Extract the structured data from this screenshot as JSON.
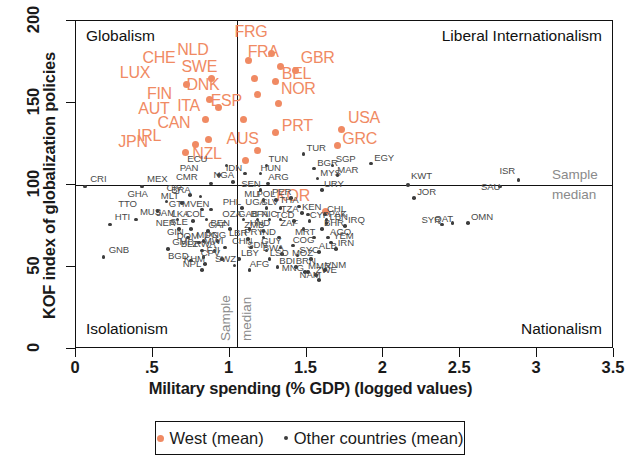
{
  "chart_data": {
    "type": "scatter",
    "title": "",
    "xlabel": "Military spending (% GDP) (logged values)",
    "ylabel": "KOF index of globalization policies",
    "xlim": [
      0,
      3.5
    ],
    "ylim": [
      0,
      200
    ],
    "xticks": [
      "0",
      ".5",
      "1",
      "1.5",
      "2",
      "2.5",
      "3",
      "3.5"
    ],
    "xtick_values": [
      0,
      0.5,
      1,
      1.5,
      2,
      2.5,
      3,
      3.5
    ],
    "yticks": [
      "0",
      "50",
      "100",
      "150",
      "200"
    ],
    "ytick_values": [
      0,
      50,
      100,
      150,
      200
    ],
    "grid": false,
    "median_x": 1.05,
    "median_y": 100,
    "median_label_line1": "Sample",
    "median_label_line2": "median",
    "quadrants": {
      "top_left": "Globalism",
      "top_right": "Liberal Internationalism",
      "bottom_left": "Isolationism",
      "bottom_right": "Nationalism"
    },
    "legend": {
      "position": "bottom-center",
      "entries": [
        {
          "name": "West (mean)",
          "color": "#f08a63",
          "marker": "circle-large"
        },
        {
          "name": "Other countries (mean)",
          "color": "#3d3d3d",
          "marker": "circle-small"
        }
      ]
    },
    "series": [
      {
        "name": "West (mean)",
        "color": "#f08a63",
        "points": [
          {
            "label": "LUX",
            "x": 0.72,
            "y": 161,
            "lx": -38,
            "ly": -9
          },
          {
            "label": "CHE",
            "x": 0.88,
            "y": 165,
            "lx": -40,
            "ly": -18
          },
          {
            "label": "FIN",
            "x": 0.87,
            "y": 152,
            "lx": -34,
            "ly": -3
          },
          {
            "label": "ITA",
            "x": 0.93,
            "y": 147,
            "lx": -13,
            "ly": 1
          },
          {
            "label": "AUT",
            "x": 0.84,
            "y": 140,
            "lx": -38,
            "ly": -8
          },
          {
            "label": "CAN",
            "x": 0.86,
            "y": 128,
            "lx": -22,
            "ly": -14
          },
          {
            "label": "IRL",
            "x": 0.78,
            "y": 125,
            "lx": -30,
            "ly": -5
          },
          {
            "label": "JPN",
            "x": 0.71,
            "y": 120,
            "lx": -38,
            "ly": -8
          },
          {
            "label": "NLD",
            "x": 1.12,
            "y": 176,
            "lx": -42,
            "ly": -8
          },
          {
            "label": "SWE",
            "x": 1.16,
            "y": 165,
            "lx": -44,
            "ly": -9
          },
          {
            "label": "DNK",
            "x": 1.18,
            "y": 155,
            "lx": -42,
            "ly": -7
          },
          {
            "label": "ESP",
            "x": 1.09,
            "y": 140,
            "lx": -4,
            "ly": -16
          },
          {
            "label": "NZL",
            "x": 1.1,
            "y": 115,
            "lx": -24,
            "ly": -4
          },
          {
            "label": "AUS",
            "x": 1.18,
            "y": 121,
            "lx": -2,
            "ly": -9
          },
          {
            "label": "FRG",
            "x": 1.27,
            "y": 180,
            "lx": -8,
            "ly": -19
          },
          {
            "label": "FRA",
            "x": 1.33,
            "y": 172,
            "lx": -4,
            "ly": -12
          },
          {
            "label": "GBR",
            "x": 1.43,
            "y": 170,
            "lx": 5,
            "ly": -10
          },
          {
            "label": "BEL",
            "x": 1.3,
            "y": 163,
            "lx": 6,
            "ly": -5
          },
          {
            "label": "NOR",
            "x": 1.32,
            "y": 150,
            "lx": 2,
            "ly": -11
          },
          {
            "label": "PRT",
            "x": 1.3,
            "y": 132,
            "lx": 6,
            "ly": -4
          },
          {
            "label": "USA",
            "x": 1.73,
            "y": 134,
            "lx": 6,
            "ly": -9
          },
          {
            "label": "GRC",
            "x": 1.7,
            "y": 124,
            "lx": 5,
            "ly": -4
          },
          {
            "label": "KOR",
            "x": 1.62,
            "y": 84,
            "lx": -20,
            "ly": -13
          }
        ]
      },
      {
        "name": "Other countries (mean)",
        "color": "#3d3d3d",
        "points": [
          {
            "label": "CRI",
            "x": 0.06,
            "y": 99,
            "lx": 5,
            "ly": -7
          },
          {
            "label": "MEX",
            "x": 0.43,
            "y": 99,
            "lx": 5,
            "ly": -7
          },
          {
            "label": "HTI",
            "x": 0.22,
            "y": 76,
            "lx": 5,
            "ly": -6
          },
          {
            "label": "GNB",
            "x": 0.18,
            "y": 56,
            "lx": 5,
            "ly": -6
          },
          {
            "label": "MUS",
            "x": 0.39,
            "y": 79,
            "lx": 4,
            "ly": -7
          },
          {
            "label": "TTO",
            "x": 0.53,
            "y": 84,
            "lx": -22,
            "ly": -6
          },
          {
            "label": "GHA",
            "x": 0.59,
            "y": 90,
            "lx": -22,
            "ly": -6
          },
          {
            "label": "MLT",
            "x": 0.69,
            "y": 89,
            "lx": -4,
            "ly": -6
          },
          {
            "label": "JAM",
            "x": 0.66,
            "y": 79,
            "lx": -4,
            "ly": -6
          },
          {
            "label": "LKA",
            "x": 0.76,
            "y": 78,
            "lx": -4,
            "ly": -6
          },
          {
            "label": "NER",
            "x": 0.67,
            "y": 73,
            "lx": -6,
            "ly": -5
          },
          {
            "label": "SLE",
            "x": 0.75,
            "y": 73,
            "lx": -4,
            "ly": -6
          },
          {
            "label": "GIN",
            "x": 0.73,
            "y": 68,
            "lx": -4,
            "ly": -5
          },
          {
            "label": "DOM",
            "x": 0.8,
            "y": 65,
            "lx": -5,
            "ly": -5
          },
          {
            "label": "PNG",
            "x": 0.83,
            "y": 66,
            "lx": 2,
            "ly": -5
          },
          {
            "label": "GMB",
            "x": 0.6,
            "y": 61,
            "lx": 4,
            "ly": -6
          },
          {
            "label": "BLZ",
            "x": 0.82,
            "y": 60,
            "lx": -4,
            "ly": -6
          },
          {
            "label": "RWA",
            "x": 0.9,
            "y": 60,
            "lx": -3,
            "ly": -6
          },
          {
            "label": "FJI",
            "x": 0.83,
            "y": 56,
            "lx": 3,
            "ly": -6
          },
          {
            "label": "BGD",
            "x": 0.75,
            "y": 54,
            "lx": -6,
            "ly": -4
          },
          {
            "label": "KHM",
            "x": 0.84,
            "y": 52,
            "lx": -4,
            "ly": -4
          },
          {
            "label": "NPL",
            "x": 0.82,
            "y": 48,
            "lx": -2,
            "ly": -5
          },
          {
            "label": "CIV",
            "x": 0.74,
            "y": 94,
            "lx": -6,
            "ly": -6
          },
          {
            "label": "BRA",
            "x": 0.81,
            "y": 93,
            "lx": -12,
            "ly": -6
          },
          {
            "label": "GTM",
            "x": 0.82,
            "y": 85,
            "lx": -16,
            "ly": -5
          },
          {
            "label": "VEN",
            "x": 0.88,
            "y": 85,
            "lx": -4,
            "ly": -5
          },
          {
            "label": "COL",
            "x": 0.85,
            "y": 79,
            "lx": -4,
            "ly": -5
          },
          {
            "label": "CAF",
            "x": 0.86,
            "y": 72,
            "lx": 0,
            "ly": -5
          },
          {
            "label": "MDG",
            "x": 0.92,
            "y": 66,
            "lx": -4,
            "ly": -5
          },
          {
            "label": "CPV",
            "x": 0.95,
            "y": 55,
            "lx": -4,
            "ly": -5
          },
          {
            "label": "MWI",
            "x": 0.97,
            "y": 62,
            "lx": -4,
            "ly": -5
          },
          {
            "label": "SWZ",
            "x": 1.03,
            "y": 51,
            "lx": -2,
            "ly": -5
          },
          {
            "label": "LBY",
            "x": 1.06,
            "y": 55,
            "lx": 2,
            "ly": -5
          },
          {
            "label": "ECU",
            "x": 0.98,
            "y": 112,
            "lx": -22,
            "ly": -5
          },
          {
            "label": "PAN",
            "x": 0.93,
            "y": 106,
            "lx": -22,
            "ly": -6
          },
          {
            "label": "CMR",
            "x": 0.88,
            "y": 101,
            "lx": -18,
            "ly": -5
          },
          {
            "label": "NGA",
            "x": 1.02,
            "y": 102,
            "lx": -2,
            "ly": -6
          },
          {
            "label": "IDN",
            "x": 1.1,
            "y": 107,
            "lx": -2,
            "ly": -5
          },
          {
            "label": "HUN",
            "x": 1.2,
            "y": 107,
            "lx": 0,
            "ly": -5
          },
          {
            "label": "ARG",
            "x": 1.25,
            "y": 101,
            "lx": 0,
            "ly": -5
          },
          {
            "label": "SEN",
            "x": 1.2,
            "y": 97,
            "lx": -2,
            "ly": -5
          },
          {
            "label": "PHL",
            "x": 1.08,
            "y": 86,
            "lx": -2,
            "ly": -5
          },
          {
            "label": "MLI",
            "x": 1.22,
            "y": 91,
            "lx": -2,
            "ly": -5
          },
          {
            "label": "POL",
            "x": 1.3,
            "y": 91,
            "lx": -2,
            "ly": -5
          },
          {
            "label": "PER",
            "x": 1.4,
            "y": 92,
            "lx": -2,
            "ly": -5
          },
          {
            "label": "UGA",
            "x": 1.24,
            "y": 86,
            "lx": -4,
            "ly": -5
          },
          {
            "label": "SLV",
            "x": 1.33,
            "y": 86,
            "lx": -2,
            "ly": -5
          },
          {
            "label": "THA",
            "x": 1.45,
            "y": 87,
            "lx": -2,
            "ly": -5
          },
          {
            "label": "TZA",
            "x": 1.51,
            "y": 82,
            "lx": -10,
            "ly": -5
          },
          {
            "label": "CHL",
            "x": 1.62,
            "y": 82,
            "lx": 2,
            "ly": -5
          },
          {
            "label": "OZA",
            "x": 1.09,
            "y": 79,
            "lx": -4,
            "ly": -5
          },
          {
            "label": "GAB",
            "x": 1.18,
            "y": 79,
            "lx": -2,
            "ly": -5
          },
          {
            "label": "BEN",
            "x": 1.0,
            "y": 73,
            "lx": -2,
            "ly": -5
          },
          {
            "label": "HND",
            "x": 1.13,
            "y": 73,
            "lx": 0,
            "ly": -5
          },
          {
            "label": "BFA",
            "x": 1.26,
            "y": 79,
            "lx": -2,
            "ly": -5
          },
          {
            "label": "NIC",
            "x": 1.33,
            "y": 79,
            "lx": -2,
            "ly": -5
          },
          {
            "label": "TCD",
            "x": 1.42,
            "y": 78,
            "lx": -2,
            "ly": -5
          },
          {
            "label": "CYP",
            "x": 1.52,
            "y": 78,
            "lx": 0,
            "ly": -5
          },
          {
            "label": "KEN",
            "x": 1.47,
            "y": 83,
            "lx": 0,
            "ly": -5
          },
          {
            "label": "ZMB",
            "x": 1.22,
            "y": 72,
            "lx": -2,
            "ly": -5
          },
          {
            "label": "ZAF",
            "x": 1.48,
            "y": 73,
            "lx": -6,
            "ly": -5
          },
          {
            "label": "BHR",
            "x": 1.6,
            "y": 73,
            "lx": 2,
            "ly": -5
          },
          {
            "label": "LBR",
            "x": 1.12,
            "y": 67,
            "lx": -2,
            "ly": -5
          },
          {
            "label": "PRY",
            "x": 1.22,
            "y": 68,
            "lx": -2,
            "ly": -5
          },
          {
            "label": "IND",
            "x": 1.32,
            "y": 68,
            "lx": -2,
            "ly": -5
          },
          {
            "label": "MRT",
            "x": 1.55,
            "y": 68,
            "lx": -2,
            "ly": -5
          },
          {
            "label": "CHN",
            "x": 1.14,
            "y": 62,
            "lx": -2,
            "ly": -5
          },
          {
            "label": "SDN",
            "x": 1.24,
            "y": 60,
            "lx": -2,
            "ly": -5
          },
          {
            "label": "GUY",
            "x": 1.33,
            "y": 62,
            "lx": -2,
            "ly": -5
          },
          {
            "label": "COG",
            "x": 1.41,
            "y": 63,
            "lx": 0,
            "ly": -5
          },
          {
            "label": "BWA",
            "x": 1.34,
            "y": 58,
            "lx": -2,
            "ly": -5
          },
          {
            "label": "SYC",
            "x": 1.44,
            "y": 57,
            "lx": 2,
            "ly": -5
          },
          {
            "label": "ALB",
            "x": 1.58,
            "y": 59,
            "lx": 0,
            "ly": -5
          },
          {
            "label": "MOZ",
            "x": 1.53,
            "y": 55,
            "lx": -2,
            "ly": -5
          },
          {
            "label": "LSO",
            "x": 1.26,
            "y": 55,
            "lx": 0,
            "ly": -5
          },
          {
            "label": "AFG",
            "x": 1.13,
            "y": 48,
            "lx": 0,
            "ly": -5
          },
          {
            "label": "BDI",
            "x": 1.31,
            "y": 50,
            "lx": 2,
            "ly": -5
          },
          {
            "label": "BRN",
            "x": 1.43,
            "y": 50,
            "lx": 0,
            "ly": -5
          },
          {
            "label": "MMR",
            "x": 1.51,
            "y": 47,
            "lx": 0,
            "ly": -5
          },
          {
            "label": "MNG",
            "x": 1.49,
            "y": 47,
            "lx": -6,
            "ly": -3
          },
          {
            "label": "ZWE",
            "x": 1.56,
            "y": 45,
            "lx": 0,
            "ly": -4
          },
          {
            "label": "NAM",
            "x": 1.58,
            "y": 42,
            "lx": -2,
            "ly": -4
          },
          {
            "label": "VNM",
            "x": 1.62,
            "y": 48,
            "lx": 0,
            "ly": -4
          },
          {
            "label": "AGO",
            "x": 1.64,
            "y": 68,
            "lx": 2,
            "ly": -5
          },
          {
            "label": "YEM",
            "x": 1.66,
            "y": 65,
            "lx": 2,
            "ly": -5
          },
          {
            "label": "IRN",
            "x": 1.69,
            "y": 61,
            "lx": 2,
            "ly": -5
          },
          {
            "label": "LBN",
            "x": 1.63,
            "y": 77,
            "lx": 3,
            "ly": -5
          },
          {
            "label": "PAK",
            "x": 1.63,
            "y": 79,
            "lx": 2,
            "ly": -5
          },
          {
            "label": "IRQ",
            "x": 1.75,
            "y": 75,
            "lx": 3,
            "ly": -5
          },
          {
            "label": "TUN",
            "x": 1.24,
            "y": 112,
            "lx": 2,
            "ly": -5
          },
          {
            "label": "TUR",
            "x": 1.48,
            "y": 119,
            "lx": 3,
            "ly": -5
          },
          {
            "label": "BGR",
            "x": 1.55,
            "y": 110,
            "lx": 3,
            "ly": -5
          },
          {
            "label": "MYS",
            "x": 1.57,
            "y": 104,
            "lx": 3,
            "ly": -5
          },
          {
            "label": "URY",
            "x": 1.6,
            "y": 97,
            "lx": 2,
            "ly": -5
          },
          {
            "label": "SGP",
            "x": 1.67,
            "y": 112,
            "lx": 3,
            "ly": -5
          },
          {
            "label": "MAR",
            "x": 1.7,
            "y": 106,
            "lx": 0,
            "ly": -4
          },
          {
            "label": "EGY",
            "x": 1.92,
            "y": 113,
            "lx": 3,
            "ly": -5
          },
          {
            "label": "KWT",
            "x": 2.16,
            "y": 100,
            "lx": 3,
            "ly": -8
          },
          {
            "label": "JOR",
            "x": 2.2,
            "y": 92,
            "lx": 3,
            "ly": -5
          },
          {
            "label": "SYR",
            "x": 2.38,
            "y": 76,
            "lx": -3,
            "ly": -3
          },
          {
            "label": "QAT",
            "x": 2.45,
            "y": 77,
            "lx": -1,
            "ly": -3
          },
          {
            "label": "OMN",
            "x": 2.55,
            "y": 77,
            "lx": 3,
            "ly": -5
          },
          {
            "label": "SAU",
            "x": 2.76,
            "y": 99,
            "lx": -2,
            "ly": 1
          },
          {
            "label": "ISR",
            "x": 2.88,
            "y": 103,
            "lx": -2,
            "ly": -8
          }
        ]
      }
    ]
  }
}
